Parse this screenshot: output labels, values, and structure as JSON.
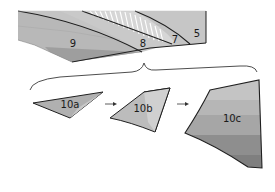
{
  "diagram": {
    "upper_section": {
      "layers": [
        {
          "id": "5",
          "label": "5"
        },
        {
          "id": "7",
          "label": "7"
        },
        {
          "id": "8",
          "label": "8"
        },
        {
          "id": "9",
          "label": "9"
        }
      ],
      "hatched_region": "striated-wedge"
    },
    "connector": {
      "type": "curly-brace",
      "orientation": "opens-downward"
    },
    "sequence": {
      "items": [
        {
          "id": "10a",
          "label": "10a"
        },
        {
          "id": "10b",
          "label": "10b"
        },
        {
          "id": "10c",
          "label": "10c"
        }
      ],
      "arrows": [
        "arrow-right",
        "arrow-right"
      ]
    },
    "colors": {
      "light_gray": "#c9c9c9",
      "mid_gray": "#b3b3b3",
      "dark_gray": "#9a9a9a",
      "darker_gray": "#8a8a8a",
      "outline": "#1f1f1f",
      "hatch": "#ffffff",
      "background": "#ffffff"
    }
  }
}
